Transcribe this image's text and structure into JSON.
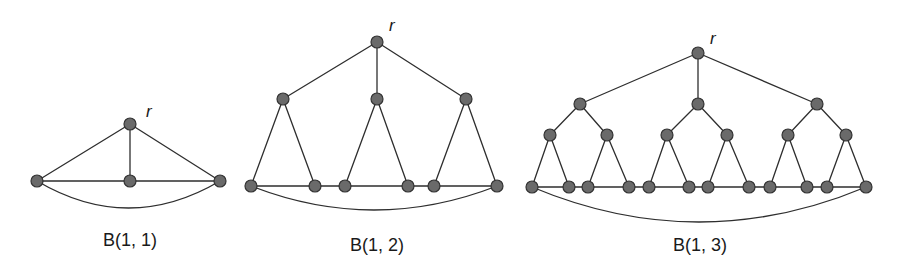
{
  "figure": {
    "background": "#ffffff",
    "node_fill": "#6a6a6a",
    "node_stroke": "#333333",
    "edge_color": "#2e2e2e",
    "node_radius": 6
  },
  "graphs": [
    {
      "id": "b11",
      "caption": "B(1, 1)",
      "caption_pos": [
        130,
        246
      ],
      "root_label": "r",
      "root_label_pos": [
        146,
        117
      ],
      "nodes": [
        [
          130,
          124
        ],
        [
          37,
          181
        ],
        [
          130,
          181
        ],
        [
          220,
          181
        ]
      ],
      "tree_edges": [
        [
          0,
          1
        ],
        [
          0,
          2
        ],
        [
          0,
          3
        ]
      ],
      "leaves": [
        1,
        2,
        3
      ],
      "arc": {
        "from": 1,
        "to": 3,
        "depth": 27
      }
    },
    {
      "id": "b12",
      "caption": "B(1, 2)",
      "caption_pos": [
        377,
        251
      ],
      "root_label": "r",
      "root_label_pos": [
        389,
        31
      ],
      "nodes": [
        [
          377,
          42
        ],
        [
          283,
          99
        ],
        [
          377,
          99
        ],
        [
          466,
          99
        ],
        [
          251,
          186
        ],
        [
          315,
          186
        ],
        [
          345,
          186
        ],
        [
          408,
          186
        ],
        [
          434,
          186
        ],
        [
          497,
          186
        ]
      ],
      "tree_edges": [
        [
          0,
          1
        ],
        [
          0,
          2
        ],
        [
          0,
          3
        ],
        [
          1,
          4
        ],
        [
          1,
          5
        ],
        [
          2,
          6
        ],
        [
          2,
          7
        ],
        [
          3,
          8
        ],
        [
          3,
          9
        ]
      ],
      "leaves": [
        4,
        5,
        6,
        7,
        8,
        9
      ],
      "arc": {
        "from": 4,
        "to": 9,
        "depth": 24
      }
    },
    {
      "id": "b13",
      "caption": "B(1, 3)",
      "caption_pos": [
        700,
        251
      ],
      "root_label": "r",
      "root_label_pos": [
        710,
        44
      ],
      "nodes": [
        [
          698,
          53
        ],
        [
          580,
          104
        ],
        [
          698,
          104
        ],
        [
          817,
          104
        ],
        [
          550,
          135
        ],
        [
          607,
          135
        ],
        [
          667,
          135
        ],
        [
          727,
          135
        ],
        [
          788,
          135
        ],
        [
          846,
          135
        ],
        [
          532,
          187
        ],
        [
          569,
          187
        ],
        [
          588,
          187
        ],
        [
          629,
          187
        ],
        [
          649,
          187
        ],
        [
          689,
          187
        ],
        [
          708,
          187
        ],
        [
          749,
          187
        ],
        [
          770,
          187
        ],
        [
          807,
          187
        ],
        [
          827,
          187
        ],
        [
          866,
          187
        ]
      ],
      "tree_edges": [
        [
          0,
          1
        ],
        [
          0,
          2
        ],
        [
          0,
          3
        ],
        [
          1,
          4
        ],
        [
          1,
          5
        ],
        [
          2,
          6
        ],
        [
          2,
          7
        ],
        [
          3,
          8
        ],
        [
          3,
          9
        ],
        [
          4,
          10
        ],
        [
          4,
          11
        ],
        [
          5,
          12
        ],
        [
          5,
          13
        ],
        [
          6,
          14
        ],
        [
          6,
          15
        ],
        [
          7,
          16
        ],
        [
          7,
          17
        ],
        [
          8,
          18
        ],
        [
          8,
          19
        ],
        [
          9,
          20
        ],
        [
          9,
          21
        ]
      ],
      "leaves": [
        10,
        11,
        12,
        13,
        14,
        15,
        16,
        17,
        18,
        19,
        20,
        21
      ],
      "arc": {
        "from": 10,
        "to": 21,
        "depth": 35
      }
    }
  ]
}
